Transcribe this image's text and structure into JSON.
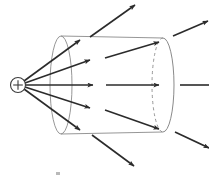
{
  "figure": {
    "width": 209,
    "height": 178,
    "background_color": "#ffffff"
  },
  "colors": {
    "stroke_dark": "#2b2b2b",
    "stroke_surface": "#8a8a8a",
    "stroke_dashed": "#8a8a8a",
    "charge_outline": "#3c3c3c",
    "background": "#ffffff"
  },
  "charge": {
    "label": "+",
    "symbol_name": "positive-point-charge",
    "center_x": 18,
    "center_y": 85,
    "radius": 7.5,
    "stroke_width": 1.1
  },
  "cylinder": {
    "name": "gaussian-cylinder",
    "left_ellipse": {
      "center_x": 61,
      "center_y": 85,
      "rx": 11,
      "ry": 49
    },
    "right_ellipse": {
      "center_x": 163,
      "center_y": 85,
      "rx": 11,
      "ry": 47
    },
    "top_edge": {
      "x1": 61,
      "y1": 36,
      "x2": 163,
      "y2": 38
    },
    "bottom_edge": {
      "x1": 61,
      "y1": 134,
      "x2": 163,
      "y2": 132
    },
    "stroke_width": 0.9,
    "dashed_arc_label": "hidden-back-rim",
    "dash_pattern": "3,3"
  },
  "field_lines": [
    {
      "name": "field-line-upper-outer",
      "x1": 24,
      "y1": 81,
      "x2": 80,
      "y2": 40,
      "arrow": true
    },
    {
      "name": "field-line-upper-inner",
      "x1": 25,
      "y1": 83,
      "x2": 90,
      "y2": 60,
      "arrow": true
    },
    {
      "name": "field-line-axial-inner",
      "x1": 26,
      "y1": 85,
      "x2": 93,
      "y2": 85,
      "arrow": true
    },
    {
      "name": "field-line-lower-inner",
      "x1": 25,
      "y1": 87,
      "x2": 90,
      "y2": 108,
      "arrow": true
    },
    {
      "name": "field-line-lower-outer",
      "x1": 24,
      "y1": 89,
      "x2": 80,
      "y2": 130,
      "arrow": true
    },
    {
      "name": "field-line-mid-upper-exit",
      "x1": 105,
      "y1": 58,
      "x2": 159,
      "y2": 42,
      "arrow": true
    },
    {
      "name": "field-line-mid-axial-exit",
      "x1": 106,
      "y1": 85,
      "x2": 159,
      "y2": 85,
      "arrow": true
    },
    {
      "name": "field-line-mid-lower-exit",
      "x1": 105,
      "y1": 110,
      "x2": 159,
      "y2": 129,
      "arrow": true
    },
    {
      "name": "field-line-top-escape",
      "x1": 90,
      "y1": 37,
      "x2": 135,
      "y2": 5,
      "arrow": true
    },
    {
      "name": "field-line-bottom-escape",
      "x1": 92,
      "y1": 135,
      "x2": 134,
      "y2": 166,
      "arrow": true
    },
    {
      "name": "field-line-right-upper",
      "x1": 173,
      "y1": 36,
      "x2": 208,
      "y2": 21,
      "arrow": true
    },
    {
      "name": "field-line-right-axial",
      "x1": 180,
      "y1": 85,
      "x2": 209,
      "y2": 85,
      "arrow": false
    },
    {
      "name": "field-line-right-lower",
      "x1": 175,
      "y1": 132,
      "x2": 209,
      "y2": 148,
      "arrow": true
    }
  ],
  "artifact": {
    "name": "scan-speck",
    "x": 56,
    "y": 172,
    "width": 4,
    "height": 3
  }
}
